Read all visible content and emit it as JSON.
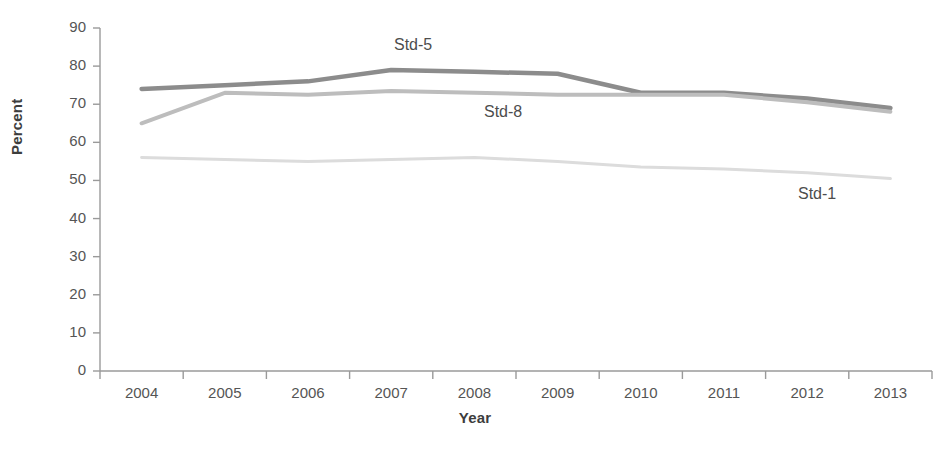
{
  "chart_data": {
    "type": "line",
    "title": "",
    "xlabel": "Year",
    "ylabel": "Percent",
    "categories": [
      "2004",
      "2005",
      "2006",
      "2007",
      "2008",
      "2009",
      "2010",
      "2011",
      "2012",
      "2013"
    ],
    "x": [
      2004,
      2005,
      2006,
      2007,
      2008,
      2009,
      2010,
      2011,
      2012,
      2013
    ],
    "ylim": [
      0,
      90
    ],
    "yticks": [
      0,
      10,
      20,
      30,
      40,
      50,
      60,
      70,
      80,
      90
    ],
    "ytick_labels": [
      "0",
      "10",
      "20",
      "30",
      "40",
      "50",
      "60",
      "70",
      "80",
      "90"
    ],
    "grid": false,
    "legend_position": "inline-annotations",
    "series": [
      {
        "name": "Std-5",
        "color": "#8c8c8c",
        "values": [
          74,
          75,
          76,
          79,
          78.5,
          78,
          73,
          73,
          71.5,
          69
        ]
      },
      {
        "name": "Std-8",
        "color": "#bdbdbd",
        "values": [
          65,
          73,
          72.5,
          73.5,
          73,
          72.5,
          72.5,
          72.5,
          70.5,
          68
        ]
      },
      {
        "name": "Std-1",
        "color": "#dcdcdc",
        "values": [
          56,
          55.5,
          55,
          55.5,
          56,
          55,
          53.5,
          53,
          52,
          50.5
        ]
      }
    ],
    "annotations": [
      {
        "text": "Std-5",
        "x_px": 394,
        "y_px": 36
      },
      {
        "text": "Std-8",
        "x_px": 484,
        "y_px": 103
      },
      {
        "text": "Std-1",
        "x_px": 798,
        "y_px": 185
      }
    ]
  },
  "axis": {
    "axis_color": "#9a9a9a",
    "tick_color": "#9a9a9a"
  }
}
